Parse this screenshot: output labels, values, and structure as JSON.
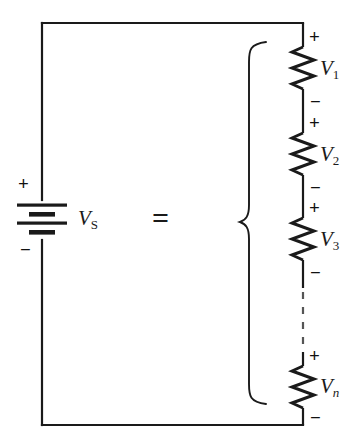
{
  "figure": {
    "type": "circuit-diagram",
    "background_color": "#ffffff",
    "stroke_color": "#1a1a1a",
    "equals_symbol": "="
  },
  "source": {
    "label": "V",
    "subscript": "S",
    "plus_sign": "+",
    "minus_sign": "−",
    "symbol": "battery-multicell"
  },
  "resistors": [
    {
      "label": "V",
      "subscript": "1",
      "subscript_italic": false,
      "plus_sign": "+",
      "minus_sign": "−"
    },
    {
      "label": "V",
      "subscript": "2",
      "subscript_italic": false,
      "plus_sign": "+",
      "minus_sign": "−"
    },
    {
      "label": "V",
      "subscript": "3",
      "subscript_italic": false,
      "plus_sign": "+",
      "minus_sign": "−"
    },
    {
      "label": "V",
      "subscript": "n",
      "subscript_italic": true,
      "plus_sign": "+",
      "minus_sign": "−"
    }
  ],
  "continuation": {
    "style": "dashed-vertical-line",
    "meaning": "additional resistors omitted"
  },
  "brace": {
    "orientation": "left-curly",
    "groups": "all series resistors"
  }
}
